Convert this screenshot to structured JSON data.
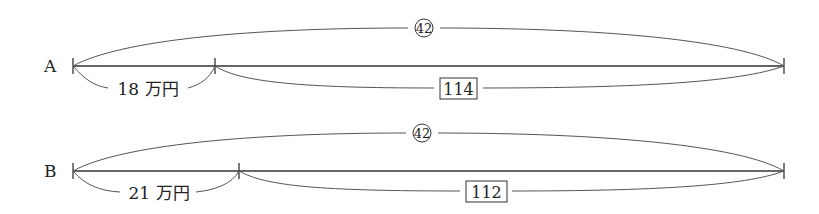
{
  "diagram": {
    "type": "line-segment-diagram",
    "stroke_color": "#333333",
    "rows": [
      {
        "label": "A",
        "total_label": "42",
        "total_style": "circled",
        "left_segment_label": "18 万円",
        "right_segment_label": "114",
        "right_segment_style": "boxed"
      },
      {
        "label": "B",
        "total_label": "42",
        "total_style": "circled",
        "left_segment_label": "21 万円",
        "right_segment_label": "112",
        "right_segment_style": "boxed"
      }
    ]
  }
}
